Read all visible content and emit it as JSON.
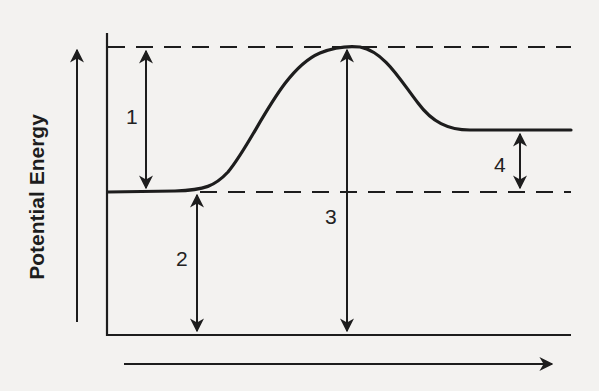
{
  "diagram": {
    "type": "potential-energy-diagram",
    "y_axis_label": "Potential Energy",
    "x_axis_label": "",
    "colors": {
      "ink": "#1d1d1d",
      "background": "#f3f2f0"
    },
    "levels": {
      "reactants_y": 192,
      "products_y": 130,
      "activated_complex_y": 47,
      "baseline_y": 335
    },
    "interval_labels": [
      {
        "id": "1",
        "text": "1",
        "meaning": "activation energy (forward)"
      },
      {
        "id": "2",
        "text": "2",
        "meaning": "potential energy of reactants"
      },
      {
        "id": "3",
        "text": "3",
        "meaning": "potential energy of activated complex"
      },
      {
        "id": "4",
        "text": "4",
        "meaning": "heat of reaction"
      }
    ]
  }
}
